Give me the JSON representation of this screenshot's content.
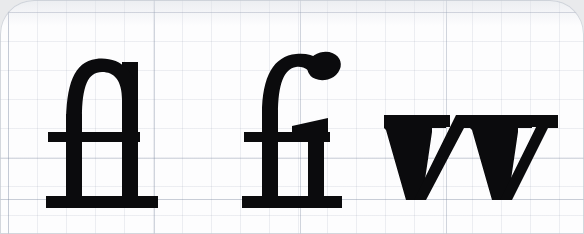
{
  "figure": {
    "kind": "scanned-typography-specimen",
    "background_color": "#fdfdfe",
    "ink_color": "#0b0b0d",
    "grid_color": "#96a0b4",
    "grid_major_color": "#7884 9e",
    "outer_color": "#e9eaec",
    "corner_radius_px": 34
  },
  "grid": {
    "minor_spacing_px": 29,
    "major_spacing_px": 146,
    "baseline_rule_y_px": 199,
    "visible": true
  },
  "glyphs": [
    {
      "id": "fl",
      "label": "fl",
      "name": "fl-ligature",
      "description": "Lowercase f and l joined; the f ascender arches over and merges into the l stem, single crossbar",
      "x_px": 22,
      "width_px": 140,
      "cap_top_px": 62,
      "crossbar_y_px": 120,
      "baseline_y_px": 196
    },
    {
      "id": "fi",
      "label": "fi",
      "name": "fi-ligature",
      "description": "Lowercase f and i joined; the f hook terminal replaces the dot of the i, crossbar runs into the i shoulder",
      "x_px": 232,
      "width_px": 118,
      "cap_top_px": 58,
      "crossbar_y_px": 120,
      "baseline_y_px": 196
    },
    {
      "id": "vv",
      "label": "vv",
      "name": "double-v-glyph",
      "description": "Two lowercase v letters side by side forming a double-v, with slab top serifs",
      "x_px": 378,
      "width_px": 170,
      "x_height_top_px": 115,
      "baseline_y_px": 199
    }
  ]
}
